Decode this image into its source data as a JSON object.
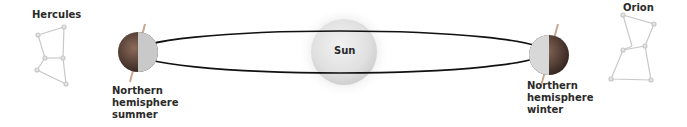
{
  "constellations": {
    "left": {
      "name": "Hercules"
    },
    "right": {
      "name": "Orion"
    }
  },
  "sun": {
    "label": "Sun"
  },
  "earth_summer": {
    "line1": "Northern",
    "line2": "hemisphere",
    "line3": "summer"
  },
  "earth_winter": {
    "line1": "Northern",
    "line2": "hemisphere",
    "line3": "winter"
  },
  "colors": {
    "orbit": "#111111",
    "sun": "#e6e6e6",
    "constellation_line": "#c8c8c8",
    "text": "#2a2a2a"
  }
}
